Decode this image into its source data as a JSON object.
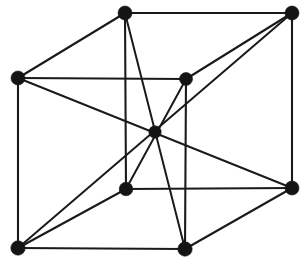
{
  "figure": {
    "background_color": "#ffffff",
    "line_color": "#1a1a1a",
    "node_color": "#141414",
    "width": 305,
    "height": 264
  },
  "chart_data": {
    "type": "diagram",
    "xlabel": "",
    "ylabel": "",
    "projection": "oblique",
    "grid": false,
    "legend": null,
    "nodes": [
      {
        "id": "back-top-left",
        "label": "back-top-left",
        "x": 125,
        "y": 13,
        "radius": 7.0
      },
      {
        "id": "back-top-right",
        "label": "back-top-right",
        "x": 292,
        "y": 13,
        "radius": 7.0
      },
      {
        "id": "front-top-left",
        "label": "front-top-left",
        "x": 18,
        "y": 78,
        "radius": 7.0
      },
      {
        "id": "front-top-right",
        "label": "front-top-right",
        "x": 186,
        "y": 79,
        "radius": 6.5
      },
      {
        "id": "back-bottom-left",
        "label": "back-bottom-left",
        "x": 126,
        "y": 189,
        "radius": 6.8
      },
      {
        "id": "back-bottom-right",
        "label": "back-bottom-right",
        "x": 292,
        "y": 188,
        "radius": 7.0
      },
      {
        "id": "front-bottom-left",
        "label": "front-bottom-left",
        "x": 18,
        "y": 248,
        "radius": 7.2
      },
      {
        "id": "front-bottom-right",
        "label": "front-bottom-right",
        "x": 185,
        "y": 249,
        "radius": 7.2
      },
      {
        "id": "body-center",
        "label": "body-center",
        "x": 155,
        "y": 132,
        "radius": 6.2
      }
    ],
    "edges": [
      {
        "from": "back-top-left",
        "to": "back-top-right",
        "kind": "cube-edge"
      },
      {
        "from": "back-top-left",
        "to": "front-top-left",
        "kind": "cube-edge"
      },
      {
        "from": "back-top-right",
        "to": "front-top-right",
        "kind": "cube-edge"
      },
      {
        "from": "front-top-left",
        "to": "front-top-right",
        "kind": "cube-edge"
      },
      {
        "from": "front-bottom-left",
        "to": "front-bottom-right",
        "kind": "cube-edge"
      },
      {
        "from": "front-bottom-right",
        "to": "back-bottom-right",
        "kind": "cube-edge"
      },
      {
        "from": "back-bottom-left",
        "to": "back-bottom-right",
        "kind": "cube-edge"
      },
      {
        "from": "front-bottom-left",
        "to": "back-bottom-left",
        "kind": "cube-edge"
      },
      {
        "from": "back-top-left",
        "to": "back-bottom-left",
        "kind": "cube-edge"
      },
      {
        "from": "back-top-right",
        "to": "back-bottom-right",
        "kind": "cube-edge"
      },
      {
        "from": "front-top-left",
        "to": "front-bottom-left",
        "kind": "cube-edge"
      },
      {
        "from": "front-top-right",
        "to": "front-bottom-right",
        "kind": "cube-edge"
      },
      {
        "from": "back-top-left",
        "to": "front-bottom-right",
        "kind": "body-diagonal"
      },
      {
        "from": "back-top-right",
        "to": "front-bottom-left",
        "kind": "body-diagonal"
      },
      {
        "from": "front-top-left",
        "to": "back-bottom-right",
        "kind": "body-diagonal"
      },
      {
        "from": "front-top-right",
        "to": "back-bottom-left",
        "kind": "body-diagonal"
      }
    ],
    "counts": {
      "corner_atoms": 8,
      "center_atoms": 1,
      "total_atoms": 9,
      "cube_edges": 12,
      "body_diagonals": 4
    }
  }
}
